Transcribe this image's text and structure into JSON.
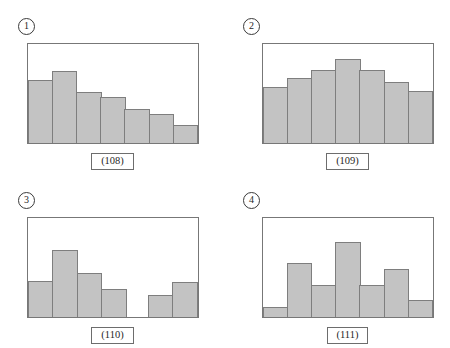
{
  "figure": {
    "background_color": "#ffffff",
    "bar_fill_color": "#c3c3c3",
    "bar_border_color": "#7e7e7e",
    "frame_border_color": "#777777"
  },
  "panels": [
    {
      "index_label": "①",
      "index_number": "1",
      "caption": "(108)",
      "shape": "decreasing / right-skewed"
    },
    {
      "index_label": "②",
      "index_number": "2",
      "caption": "(109)",
      "shape": "symmetric / bell-shaped"
    },
    {
      "index_label": "③",
      "index_number": "3",
      "caption": "(110)",
      "shape": "gapped / cluster with empty class"
    },
    {
      "index_label": "④",
      "index_number": "4",
      "caption": "(111)",
      "shape": "irregular / jagged"
    }
  ],
  "chart_data": [
    {
      "type": "bar",
      "title": "(108)",
      "panel": "①",
      "categories": [
        "1",
        "2",
        "3",
        "4",
        "5",
        "6",
        "7"
      ],
      "values": [
        64,
        73,
        52,
        46,
        34,
        29,
        18
      ],
      "xlabel": "",
      "ylabel": "",
      "ylim": [
        0,
        100
      ],
      "grid": false,
      "legend": "none",
      "description": "Histogram with bars decreasing from left to right except the second bar which is the tallest; right-skewed shape."
    },
    {
      "type": "bar",
      "title": "(109)",
      "panel": "②",
      "categories": [
        "1",
        "2",
        "3",
        "4",
        "5",
        "6",
        "7"
      ],
      "values": [
        57,
        66,
        74,
        85,
        74,
        62,
        53
      ],
      "xlabel": "",
      "ylabel": "",
      "ylim": [
        0,
        100
      ],
      "grid": false,
      "legend": "none",
      "description": "Histogram rising to a central peak then falling; symmetric bell-shaped distribution."
    },
    {
      "type": "bar",
      "title": "(110)",
      "panel": "③",
      "categories": [
        "1",
        "2",
        "3",
        "4",
        "5",
        "6",
        "7"
      ],
      "values": [
        36,
        68,
        44,
        28,
        0,
        22,
        35
      ],
      "xlabel": "",
      "ylabel": "",
      "ylim": [
        0,
        100
      ],
      "grid": false,
      "legend": "none",
      "description": "Histogram with a main cluster on the left, an empty class in the middle, and a small isolated cluster on the right."
    },
    {
      "type": "bar",
      "title": "(111)",
      "panel": "④",
      "categories": [
        "1",
        "2",
        "3",
        "4",
        "5",
        "6",
        "7"
      ],
      "values": [
        10,
        55,
        32,
        76,
        32,
        48,
        17
      ],
      "xlabel": "",
      "ylabel": "",
      "ylim": [
        0,
        100
      ],
      "grid": false,
      "legend": "none",
      "description": "Histogram with alternating tall and short bars; irregular jagged shape."
    }
  ]
}
